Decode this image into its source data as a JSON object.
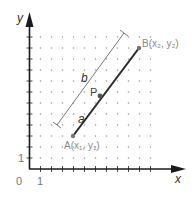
{
  "diagram": {
    "axes": {
      "x_label": "x",
      "y_label": "y",
      "origin_label": "0",
      "x_unit_label": "1",
      "y_unit_label": "1"
    },
    "points": {
      "A": {
        "label": "A(x₁, y₁)",
        "grid": [
          4,
          3
        ]
      },
      "B": {
        "label": "B(x₂, y₂)",
        "grid": [
          10,
          11
        ]
      },
      "P": {
        "label": "P"
      }
    },
    "segments": {
      "a_label": "a",
      "b_label": "b"
    },
    "colors": {
      "axis": "#1a1a1a",
      "segment": "#2a2a2a",
      "point": "#777777",
      "grid_dot": "#9a9a9a",
      "label_gray": "#8a8a8a",
      "measure_line": "#555555"
    }
  }
}
